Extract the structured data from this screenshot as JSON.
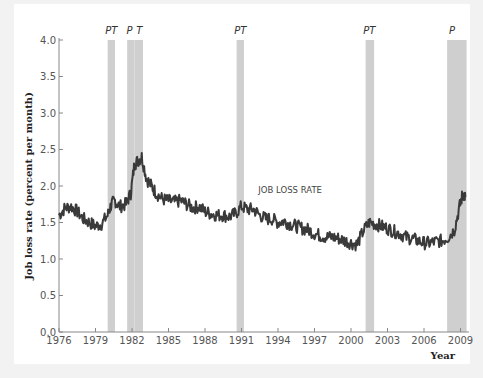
{
  "chart_data": {
    "type": "line",
    "title": "",
    "xlabel": "Year",
    "ylabel": "Job loss rate (percent per month)",
    "xlim": [
      1976,
      2009.5
    ],
    "ylim": [
      0.0,
      4.0
    ],
    "x_ticks": [
      "1976",
      "1979",
      "1982",
      "1985",
      "1988",
      "1991",
      "1994",
      "1997",
      "2000",
      "2003",
      "2006",
      "2009"
    ],
    "y_ticks": [
      "0.0",
      "0.5",
      "1.0",
      "1.5",
      "2.0",
      "2.5",
      "3.0",
      "3.5",
      "4.0"
    ],
    "grid": false,
    "annotations": [
      {
        "text": "JOB LOSS RATE",
        "x": 1995,
        "y": 1.9
      }
    ],
    "recession_bands": [
      {
        "label": "PT",
        "start": 1980.0,
        "end": 1980.6
      },
      {
        "label": "P",
        "start": 1981.6,
        "end": 1982.2
      },
      {
        "label": "T",
        "start": 1982.2,
        "end": 1982.9
      },
      {
        "label": "PT",
        "start": 1990.6,
        "end": 1991.2
      },
      {
        "label": "PT",
        "start": 2001.2,
        "end": 2001.9
      },
      {
        "label": "P",
        "start": 2007.9,
        "end": 2009.5
      }
    ],
    "series": [
      {
        "name": "Job loss rate",
        "x": [
          1976.0,
          1976.5,
          1977.0,
          1977.5,
          1978.0,
          1978.5,
          1979.0,
          1979.5,
          1980.0,
          1980.3,
          1980.6,
          1981.0,
          1981.5,
          1981.9,
          1982.2,
          1982.5,
          1982.8,
          1983.2,
          1983.6,
          1984.0,
          1984.5,
          1985.0,
          1985.5,
          1986.0,
          1986.5,
          1987.0,
          1987.5,
          1988.0,
          1988.5,
          1989.0,
          1989.5,
          1990.0,
          1990.5,
          1991.0,
          1991.5,
          1992.0,
          1992.5,
          1993.0,
          1993.5,
          1994.0,
          1994.5,
          1995.0,
          1995.5,
          1996.0,
          1996.5,
          1997.0,
          1997.5,
          1998.0,
          1998.5,
          1999.0,
          1999.5,
          2000.0,
          2000.5,
          2001.0,
          2001.5,
          2002.0,
          2002.5,
          2003.0,
          2003.5,
          2004.0,
          2004.5,
          2005.0,
          2005.5,
          2006.0,
          2006.5,
          2007.0,
          2007.5,
          2008.0,
          2008.5,
          2008.9,
          2009.2,
          2009.4
        ],
        "values": [
          1.6,
          1.7,
          1.72,
          1.65,
          1.55,
          1.5,
          1.45,
          1.48,
          1.6,
          1.75,
          1.8,
          1.72,
          1.75,
          1.9,
          2.3,
          2.35,
          2.4,
          2.1,
          2.0,
          1.9,
          1.82,
          1.8,
          1.78,
          1.8,
          1.75,
          1.7,
          1.72,
          1.65,
          1.62,
          1.6,
          1.6,
          1.58,
          1.62,
          1.72,
          1.68,
          1.68,
          1.6,
          1.55,
          1.55,
          1.5,
          1.52,
          1.48,
          1.45,
          1.42,
          1.4,
          1.35,
          1.32,
          1.3,
          1.3,
          1.28,
          1.25,
          1.22,
          1.2,
          1.38,
          1.5,
          1.48,
          1.45,
          1.42,
          1.38,
          1.35,
          1.3,
          1.28,
          1.25,
          1.22,
          1.22,
          1.24,
          1.25,
          1.3,
          1.4,
          1.7,
          1.9,
          1.85
        ]
      }
    ]
  }
}
